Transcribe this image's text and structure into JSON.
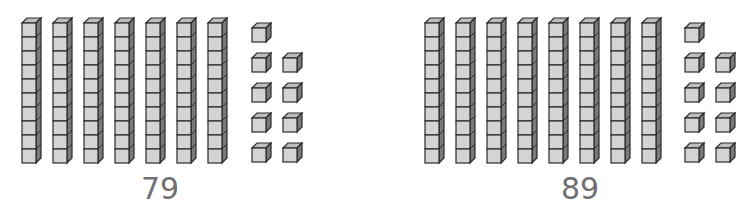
{
  "diagram": {
    "type": "base-ten-blocks",
    "colors": {
      "face": "#d4d4d4",
      "top": "#bdbdbd",
      "side": "#7a7a7a",
      "outline": "#2a2a2a",
      "label": "#707070"
    },
    "groups": [
      {
        "label": "79",
        "tens": 7,
        "ones": 9,
        "rod_x": [
          22,
          53,
          84,
          115,
          146,
          177,
          208
        ],
        "unit_cols": [
          252,
          283
        ],
        "unit_rows": [
          23,
          53,
          83,
          113,
          143
        ],
        "label_x": 120
      },
      {
        "label": "89",
        "tens": 8,
        "ones": 9,
        "rod_x": [
          425,
          456,
          487,
          518,
          549,
          580,
          611,
          642
        ],
        "unit_cols": [
          685,
          716
        ],
        "unit_rows": [
          23,
          53,
          83,
          113,
          143
        ],
        "label_x": 540
      }
    ]
  }
}
